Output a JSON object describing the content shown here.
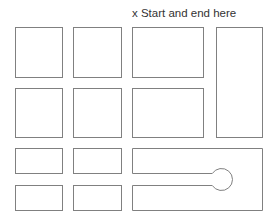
{
  "diagram": {
    "label": "x Start and end here",
    "stroke_color": "#808080",
    "background": "#ffffff",
    "rooms": [
      {
        "id": "r1c1",
        "x": 15,
        "y": 27,
        "w": 47,
        "h": 50
      },
      {
        "id": "r1c2",
        "x": 73,
        "y": 27,
        "w": 48,
        "h": 50
      },
      {
        "id": "r1c3",
        "x": 132,
        "y": 27,
        "w": 71,
        "h": 50
      },
      {
        "id": "tall-right",
        "x": 216,
        "y": 27,
        "w": 46,
        "h": 110
      },
      {
        "id": "r2c1",
        "x": 15,
        "y": 88,
        "w": 47,
        "h": 49
      },
      {
        "id": "r2c2",
        "x": 73,
        "y": 88,
        "w": 48,
        "h": 49
      },
      {
        "id": "r2c3",
        "x": 132,
        "y": 88,
        "w": 71,
        "h": 49
      },
      {
        "id": "r3c1",
        "x": 15,
        "y": 148,
        "w": 47,
        "h": 25
      },
      {
        "id": "r3c2",
        "x": 73,
        "y": 148,
        "w": 48,
        "h": 25
      },
      {
        "id": "r4c1",
        "x": 15,
        "y": 185,
        "w": 47,
        "h": 25
      },
      {
        "id": "r4c2",
        "x": 73,
        "y": 185,
        "w": 48,
        "h": 25
      }
    ],
    "keyhole_shape": {
      "x": 132,
      "y": 148,
      "w": 130,
      "h": 62,
      "slot_top": 173,
      "slot_bottom": 185,
      "circle_cx": 221,
      "circle_cy": 179,
      "circle_r": 11
    }
  }
}
